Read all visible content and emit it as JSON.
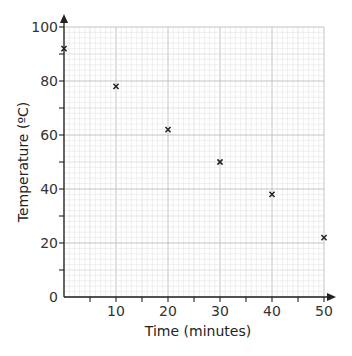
{
  "chart_data": {
    "type": "scatter",
    "title": "",
    "xlabel": "Time (minutes)",
    "ylabel": "Temperature (ºC)",
    "xlim": [
      0,
      50
    ],
    "ylim": [
      0,
      100
    ],
    "x_ticks": [
      0,
      10,
      20,
      30,
      40,
      50
    ],
    "y_ticks": [
      0,
      20,
      40,
      60,
      80,
      100
    ],
    "x_tick_labels": [
      "10",
      "20",
      "30",
      "40",
      "50"
    ],
    "y_tick_labels": [
      "0",
      "20",
      "40",
      "60",
      "80",
      "100"
    ],
    "grid": true,
    "marker": "x",
    "series": [
      {
        "name": "Temperature",
        "x": [
          0,
          10,
          20,
          30,
          40,
          50
        ],
        "y": [
          92,
          78,
          62,
          50,
          38,
          22
        ]
      }
    ]
  },
  "labels": {
    "x_axis": "Time (minutes)",
    "y_axis": "Temperature (ºC)",
    "origin": "0"
  },
  "colors": {
    "axis": "#222222",
    "grid_minor": "#e4e4e4",
    "grid_major": "#bdbdbd",
    "marker": "#222222"
  }
}
